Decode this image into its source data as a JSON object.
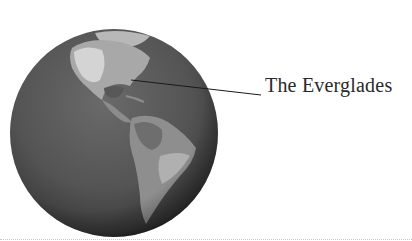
{
  "diagram": {
    "label": "The Everglades",
    "globe": {
      "cx": 114,
      "cy": 133,
      "r": 104
    },
    "leader_line": {
      "x1": 131,
      "y1": 80,
      "x2": 261,
      "y2": 95
    },
    "colors": {
      "ocean": "#555555",
      "land": "#9a9a9a",
      "land_light": "#d0d0d0",
      "text": "#2a2a2a"
    }
  }
}
